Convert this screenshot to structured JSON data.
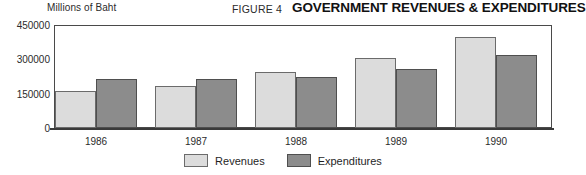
{
  "header": {
    "unit_label": "Millions of Baht",
    "figure_number": "FIGURE 4",
    "title": "GOVERNMENT REVENUES & EXPENDITURES"
  },
  "legend": {
    "revenues_label": "Revenues",
    "expenditures_label": "Expenditures"
  },
  "colors": {
    "revenues": "#dcdcdc",
    "expenditures": "#8c8c8c",
    "axis": "#4a4a4a",
    "text": "#1a1a1a"
  },
  "chart_data": {
    "type": "bar",
    "title": "GOVERNMENT REVENUES & EXPENDITURES",
    "subtitle": "FIGURE 4",
    "xlabel": "",
    "ylabel": "Millions of Baht",
    "categories": [
      "1986",
      "1987",
      "1988",
      "1989",
      "1990"
    ],
    "series": [
      {
        "name": "Revenues",
        "values": [
          162000,
          184000,
          245000,
          306000,
          398000
        ]
      },
      {
        "name": "Expenditures",
        "values": [
          214000,
          214000,
          223000,
          258000,
          319000
        ]
      }
    ],
    "ylim": [
      0,
      450000
    ],
    "yticks": [
      0,
      150000,
      300000,
      450000
    ],
    "ytick_labels": [
      "0",
      "150000",
      "300000",
      "450000"
    ],
    "grid": false,
    "legend_position": "bottom-center"
  }
}
